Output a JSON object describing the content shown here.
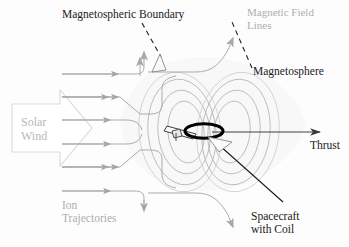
{
  "figure": {
    "background_color": "#fdfdfd"
  },
  "colors": {
    "dark_text": "#1a1a1a",
    "gray_text": "#aeaeae",
    "field_line": "#b4b4b4",
    "ion_arrow": "#a0a0a0",
    "solar_wind_outline": "#d8d8d8",
    "coil_black": "#000000",
    "boundary_dash": "#1a1a1a"
  },
  "labels": {
    "magnetospheric_boundary": "Magnetospheric Boundary",
    "magnetic_field_lines_1": "Magnetic Field",
    "magnetic_field_lines_2": "Lines",
    "magnetosphere": "Magnetosphere",
    "solar_wind_1": "Solar",
    "solar_wind_2": "Wind",
    "thrust": "Thrust",
    "ion_trajectories_1": "Ion",
    "ion_trajectories_2": "Trajectories",
    "spacecraft_1": "Spacecraft",
    "spacecraft_2": "with Coil"
  },
  "elements": {
    "solar_wind_arrow": "large block arrow at left pointing right",
    "ion_trajectory_count": 6,
    "field_line_lobes": 2,
    "field_lines_per_lobe": 3,
    "coil": "bold black ellipse at center",
    "spacecraft_body": "small boom structure left of coil",
    "thrust_arrow": "horizontal arrow to right edge"
  }
}
